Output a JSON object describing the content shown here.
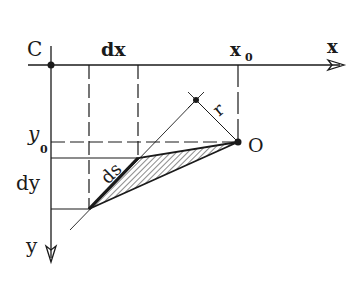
{
  "diagram": {
    "labels": {
      "origin": "C",
      "dx": "dx",
      "x0": "x",
      "x0_sub": "0",
      "x_axis": "x",
      "y0": "y",
      "y0_sub": "0",
      "dy": "dy",
      "y_axis": "y",
      "ds": "ds",
      "r": "r",
      "point_O": "O"
    },
    "colors": {
      "ink": "#1a1a1a",
      "background": "#ffffff"
    }
  }
}
